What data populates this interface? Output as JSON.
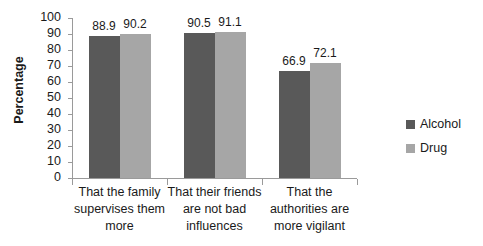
{
  "chart_data": {
    "type": "bar",
    "title": "",
    "subtitle": "",
    "xlabel": "",
    "ylabel": "Percentage",
    "ylim": [
      0,
      100
    ],
    "ytick_labels": [
      "100",
      "90",
      "80",
      "70",
      "60",
      "50",
      "40",
      "30",
      "20",
      "10",
      "0"
    ],
    "ytick_values": [
      100,
      90,
      80,
      70,
      60,
      50,
      40,
      30,
      20,
      10,
      0
    ],
    "grid": false,
    "legend_position": "right",
    "categories": [
      "That the family supervises them more",
      "That their friends are not bad influences",
      "That the authorities are more vigilant"
    ],
    "category_lines": [
      [
        "That the family",
        "supervises them",
        "more"
      ],
      [
        "That their friends",
        "are not bad",
        "influences"
      ],
      [
        "That the",
        "authorities are",
        "more vigilant"
      ]
    ],
    "series": [
      {
        "name": "Alcohol",
        "color": "#595959",
        "values": [
          88.9,
          90.5,
          66.9
        ],
        "labels": [
          "88.9",
          "90.5",
          "66.9"
        ]
      },
      {
        "name": "Drug",
        "color": "#a6a6a6",
        "values": [
          90.2,
          91.1,
          72.1
        ],
        "labels": [
          "90.2",
          "91.1",
          "72.1"
        ]
      }
    ]
  },
  "legend": {
    "items": [
      {
        "label": "Alcohol",
        "color": "#595959"
      },
      {
        "label": "Drug",
        "color": "#a6a6a6"
      }
    ]
  },
  "axis": {
    "y_title": "Percentage"
  }
}
